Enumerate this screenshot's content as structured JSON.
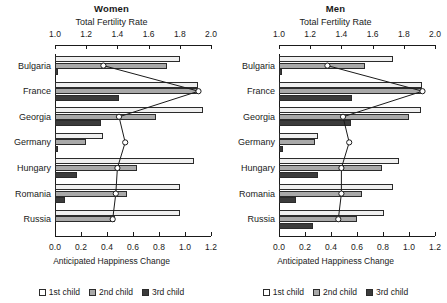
{
  "chart_data": {
    "type": "bar",
    "title": "",
    "orientation": "horizontal",
    "grid": false,
    "legend_position": "bottom",
    "categories": [
      "Bulgaria",
      "France",
      "Georgia",
      "Germany",
      "Hungary",
      "Romania",
      "Russia"
    ],
    "xlabel": "Anticipated Happiness Change",
    "xlim": [
      0.0,
      1.2
    ],
    "xticks": [
      "0.0",
      "0.2",
      "0.4",
      "0.6",
      "0.8",
      "1.0",
      "1.2"
    ],
    "xtick_values": [
      0.0,
      0.2,
      0.4,
      0.6,
      0.8,
      1.0,
      1.2
    ],
    "secondary_axis_label": "Total Fertility Rate",
    "secondary_xlim": [
      1.0,
      2.0
    ],
    "secondary_xticks": [
      "1.0",
      "1.2",
      "1.4",
      "1.6",
      "1.8",
      "2.0"
    ],
    "secondary_xtick_values": [
      1.0,
      1.2,
      1.4,
      1.6,
      1.8,
      2.0
    ],
    "legend": [
      "1st child",
      "2nd child",
      "3rd child"
    ],
    "colors": {
      "1st child": "#efefef",
      "2nd child": "#a9a9a9",
      "3rd child": "#3b3b3b",
      "outline": "#2b2b2b",
      "marker": "#ffffff"
    },
    "panels": [
      {
        "name": "Women",
        "series": [
          {
            "name": "1st child",
            "values": [
              0.96,
              1.1,
              1.14,
              0.37,
              1.07,
              0.96,
              0.96
            ]
          },
          {
            "name": "2nd child",
            "values": [
              0.86,
              1.1,
              0.78,
              0.24,
              0.63,
              0.55,
              0.46
            ]
          },
          {
            "name": "3rd child",
            "values": [
              0.02,
              0.49,
              0.35,
              0.02,
              0.17,
              0.08,
              0.0
            ]
          }
        ],
        "total_fertility_rate": [
          1.31,
          1.92,
          1.41,
          1.45,
          1.4,
          1.39,
          1.37
        ]
      },
      {
        "name": "Men",
        "series": [
          {
            "name": "1st child",
            "values": [
              0.88,
              1.1,
              1.09,
              0.3,
              0.92,
              0.88,
              0.81
            ]
          },
          {
            "name": "2nd child",
            "values": [
              0.66,
              1.1,
              1.0,
              0.28,
              0.79,
              0.64,
              0.6
            ]
          },
          {
            "name": "3rd child",
            "values": [
              0.02,
              0.56,
              0.55,
              0.03,
              0.3,
              0.13,
              0.26
            ]
          }
        ],
        "total_fertility_rate": [
          1.31,
          1.92,
          1.41,
          1.45,
          1.4,
          1.4,
          1.38
        ]
      }
    ]
  }
}
